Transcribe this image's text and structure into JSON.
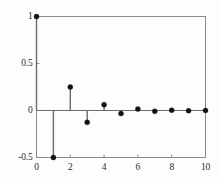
{
  "chart_data": {
    "type": "stem",
    "title": "",
    "xlabel": "",
    "ylabel": "",
    "x": [
      0,
      1,
      2,
      3,
      4,
      5,
      6,
      7,
      8,
      9,
      10
    ],
    "values": [
      1.0,
      -0.5,
      0.25,
      -0.125,
      0.0625,
      -0.03125,
      0.015625,
      -0.0078125,
      0.00390625,
      -0.001953125,
      0.0009765625
    ],
    "series": [
      {
        "name": "impulse response",
        "values": [
          1.0,
          -0.5,
          0.25,
          -0.125,
          0.0625,
          -0.03125,
          0.015625,
          -0.0078125,
          0.00390625,
          -0.001953125,
          0.0009765625
        ]
      }
    ],
    "xlim": [
      0,
      10
    ],
    "ylim": [
      -0.5,
      1
    ],
    "xticks": [
      0,
      2,
      4,
      6,
      8,
      10
    ],
    "xtick_labels": [
      "0",
      "2",
      "4",
      "6",
      "8",
      "10"
    ],
    "yticks": [
      -0.5,
      0,
      0.5,
      1
    ],
    "ytick_labels": [
      "-0.5",
      "0",
      "0.5",
      "1"
    ],
    "grid": false,
    "legend": null,
    "baseline": 0,
    "marker": "filled-circle",
    "colors": {
      "line": "#6b6b6b",
      "marker": "#111111",
      "axis": "#8a8a8a",
      "text": "#2b2b2b",
      "background": "#fdfdfd"
    }
  }
}
